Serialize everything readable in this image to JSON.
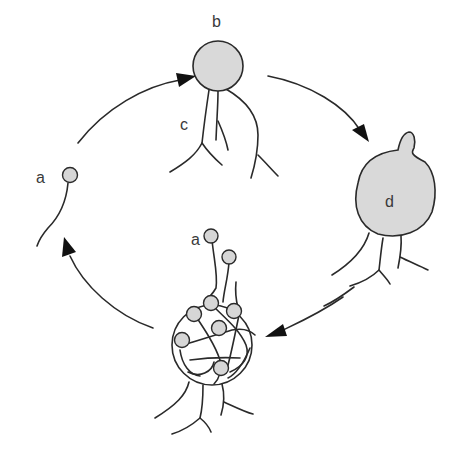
{
  "diagram": {
    "type": "life-cycle",
    "labels": {
      "spore_left": "a",
      "spore_bottom": "a",
      "cell_top": "b",
      "filaments": "c",
      "cell_right": "d"
    },
    "stages": [
      {
        "id": "a",
        "description": "single small spore with tail (left)"
      },
      {
        "id": "b",
        "description": "round cell with branching filaments c (top)"
      },
      {
        "id": "d",
        "description": "large round cell with bud on top and roots (right)"
      },
      {
        "id": "sac",
        "description": "circular sac with multiple spores and tangled filaments, releasing spores a (bottom)"
      }
    ],
    "arrows": [
      {
        "from": "a",
        "to": "b",
        "direction": "clockwise"
      },
      {
        "from": "b",
        "to": "d",
        "direction": "clockwise"
      },
      {
        "from": "d",
        "to": "sac",
        "direction": "clockwise"
      },
      {
        "from": "sac",
        "to": "a",
        "direction": "clockwise"
      }
    ],
    "colors": {
      "fill": "#d9d9d9",
      "stroke": "#2a2a2a",
      "arrowhead": "#111111",
      "background": "#ffffff"
    }
  }
}
